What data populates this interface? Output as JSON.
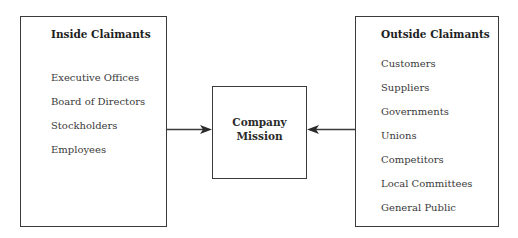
{
  "diagram": {
    "inside": {
      "title": "Inside Claimants",
      "items": [
        "Executive Offices",
        "Board of Directors",
        "Stockholders",
        "Employees"
      ]
    },
    "center": {
      "line1": "Company",
      "line2": "Mission"
    },
    "outside": {
      "title": "Outside Claimants",
      "items": [
        "Customers",
        "Suppliers",
        "Governments",
        "Unions",
        "Competitors",
        "Local Committees",
        "General Public"
      ]
    },
    "arrows": [
      {
        "from": "Inside Claimants",
        "to": "Company Mission"
      },
      {
        "from": "Outside Claimants",
        "to": "Company Mission"
      }
    ],
    "colors": {
      "line": "#3a3a3a",
      "text": "#2a2a2a",
      "background": "#ffffff"
    }
  }
}
